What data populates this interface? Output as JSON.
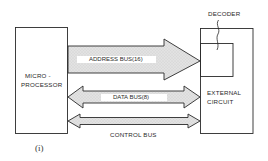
{
  "diagram": {
    "microprocessor": {
      "label_line1": "MICRO -",
      "label_line2": "PROCESSOR"
    },
    "external_circuit": {
      "label_line1": "EXTERNAL",
      "label_line2": "CIRCUIT"
    },
    "decoder": {
      "label": "DECODER"
    },
    "buses": [
      {
        "name": "address-bus",
        "label": "ADDRESS BUS(16)",
        "direction": "to-external"
      },
      {
        "name": "data-bus",
        "label": "DATA BUS(8)",
        "direction": "bidirectional"
      },
      {
        "name": "control-bus",
        "label": "CONTROL BUS",
        "direction": "bidirectional"
      }
    ],
    "caption": "(i)",
    "colors": {
      "line": "#2a2a2a",
      "bus_fill": "#dcdcdc",
      "background": "#ffffff"
    }
  }
}
